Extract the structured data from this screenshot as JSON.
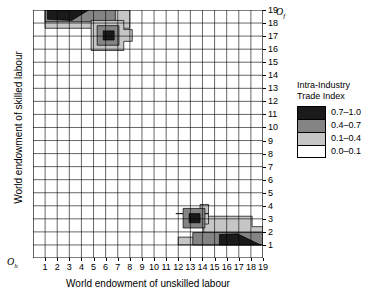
{
  "chart_data": {
    "type": "heatmap",
    "title": "",
    "xlabel": "World endowment of unskilled labour",
    "ylabel": "World endowment of skilled labour",
    "xlim": [
      0,
      19
    ],
    "ylim": [
      0,
      19
    ],
    "grid": true,
    "x_tick_labels": [
      "1",
      "2",
      "3",
      "4",
      "5",
      "6",
      "7",
      "8",
      "9",
      "10",
      "11",
      "12",
      "13",
      "14",
      "15",
      "16",
      "17",
      "18",
      "19"
    ],
    "y_tick_labels": [
      "1",
      "2",
      "3",
      "4",
      "5",
      "6",
      "7",
      "8",
      "9",
      "10",
      "11",
      "12",
      "13",
      "14",
      "15",
      "16",
      "17",
      "18",
      "19"
    ],
    "x_origin_label": "Oh",
    "y_origin_label": "Of",
    "y_axis_side": "right",
    "legend": {
      "title_line1": "Intra-Industry",
      "title_line2": "Trade Index",
      "position": "right",
      "entries": [
        {
          "label": "0.7–1.0",
          "color": "#1a1a1a",
          "min": 0.7,
          "max": 1.0
        },
        {
          "label": "0.4–0.7",
          "color": "#848484",
          "min": 0.4,
          "max": 0.7
        },
        {
          "label": "0.1–0.4",
          "color": "#c6c6c6",
          "min": 0.1,
          "max": 0.4
        },
        {
          "label": "0.0–0.1",
          "color": "#ffffff",
          "min": 0.0,
          "max": 0.1
        }
      ]
    },
    "regions": [
      {
        "name": "upper-left-band-0.1-0.4",
        "band": "0.1–0.4",
        "color": "#c6c6c6",
        "polygon": [
          [
            1,
            19
          ],
          [
            8,
            19
          ],
          [
            8,
            17.6
          ],
          [
            7.1,
            17.6
          ],
          [
            7.1,
            16.2
          ],
          [
            5.1,
            16.2
          ],
          [
            5.1,
            17.6
          ],
          [
            1,
            17.6
          ]
        ]
      },
      {
        "name": "upper-left-band-0.4-0.7",
        "band": "0.4–0.7",
        "color": "#848484",
        "polygon": [
          [
            1,
            19
          ],
          [
            6.8,
            19
          ],
          [
            6.8,
            18.1
          ],
          [
            1,
            18.1
          ]
        ]
      },
      {
        "name": "upper-left-core-0.7-1.0",
        "band": "0.7–1.0",
        "color": "#1a1a1a",
        "polygon": [
          [
            1.2,
            19
          ],
          [
            4.6,
            19
          ],
          [
            3.2,
            18.2
          ],
          [
            1.2,
            18.3
          ]
        ]
      },
      {
        "name": "upper-blob-outer-0.1-0.4",
        "band": "0.1–0.4",
        "color": "#c6c6c6",
        "polygon": [
          [
            4.8,
            18.2
          ],
          [
            7.5,
            18.2
          ],
          [
            7.5,
            17.5
          ],
          [
            8.2,
            17.5
          ],
          [
            8.2,
            16.6
          ],
          [
            7.5,
            16.6
          ],
          [
            7.5,
            15.9
          ],
          [
            4.8,
            15.9
          ]
        ]
      },
      {
        "name": "upper-blob-mid-0.4-0.7",
        "band": "0.4–0.7",
        "color": "#848484",
        "polygon": [
          [
            5.3,
            17.8
          ],
          [
            7.1,
            17.8
          ],
          [
            7.1,
            16.3
          ],
          [
            5.3,
            16.3
          ]
        ]
      },
      {
        "name": "upper-blob-core-0.7-1.0",
        "band": "0.7–1.0",
        "color": "#1a1a1a",
        "polygon": [
          [
            5.8,
            17.4
          ],
          [
            6.7,
            17.4
          ],
          [
            6.7,
            16.7
          ],
          [
            5.8,
            16.7
          ]
        ]
      },
      {
        "name": "lower-right-band-0.1-0.4",
        "band": "0.1–0.4",
        "color": "#c6c6c6",
        "polygon": [
          [
            12,
            1
          ],
          [
            19,
            1
          ],
          [
            19,
            2.4
          ],
          [
            18.1,
            2.4
          ],
          [
            18.1,
            3.2
          ],
          [
            14.1,
            3.2
          ],
          [
            14.1,
            1.6
          ],
          [
            12,
            1.6
          ]
        ]
      },
      {
        "name": "lower-right-band-0.4-0.7",
        "band": "0.4–0.7",
        "color": "#848484",
        "polygon": [
          [
            13.2,
            1
          ],
          [
            19,
            1
          ],
          [
            19,
            1.95
          ],
          [
            13.2,
            1.95
          ]
        ]
      },
      {
        "name": "lower-right-core-0.7-1.0",
        "band": "0.7–1.0",
        "color": "#1a1a1a",
        "polygon": [
          [
            15.4,
            1
          ],
          [
            18.8,
            1
          ],
          [
            16.9,
            1.85
          ],
          [
            15.4,
            1.8
          ]
        ]
      },
      {
        "name": "lower-blob-outer-0.1-0.4",
        "band": "0.1–0.4",
        "color": "#c6c6c6",
        "polygon": [
          [
            11.8,
            3.4
          ],
          [
            14.5,
            3.4
          ],
          [
            14.5,
            4.1
          ],
          [
            13.8,
            4.1
          ],
          [
            13.8,
            2.6
          ],
          [
            14.5,
            2.6
          ],
          [
            14.5,
            3.4
          ]
        ]
      },
      {
        "name": "lower-blob-mid-0.4-0.7",
        "band": "0.4–0.7",
        "color": "#848484",
        "polygon": [
          [
            12.4,
            3.8
          ],
          [
            14.2,
            3.8
          ],
          [
            14.2,
            2.3
          ],
          [
            12.4,
            2.3
          ]
        ]
      },
      {
        "name": "lower-blob-core-0.7-1.0",
        "band": "0.7–1.0",
        "color": "#1a1a1a",
        "polygon": [
          [
            12.9,
            3.4
          ],
          [
            13.8,
            3.4
          ],
          [
            13.8,
            2.7
          ],
          [
            12.9,
            2.7
          ]
        ]
      }
    ]
  }
}
